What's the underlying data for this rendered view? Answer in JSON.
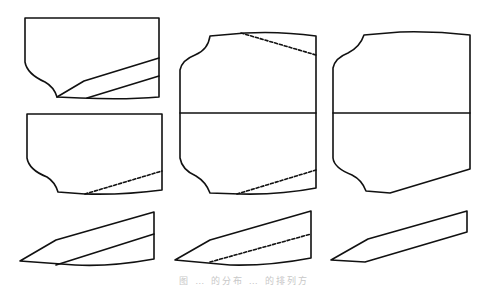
{
  "figure": {
    "caption": "图 … 的分布 … 的排列方",
    "stroke_color": "#111111",
    "background": "#ffffff",
    "panels": [
      {
        "id": "col1-top",
        "column": 1,
        "row": 1,
        "solid_inner_lines": 2,
        "dashed_inner_lines": 0
      },
      {
        "id": "col1-mid",
        "column": 1,
        "row": 2,
        "solid_inner_lines": 0,
        "dashed_inner_lines": 1
      },
      {
        "id": "col1-bottom",
        "column": 1,
        "row": 3,
        "shape": "wedge",
        "solid_inner_lines": 1,
        "dashed_inner_lines": 0
      },
      {
        "id": "col2-tall",
        "column": 2,
        "row": "1-2",
        "horizontal_divider": true,
        "dashed_inner_lines": 2
      },
      {
        "id": "col2-bottom",
        "column": 2,
        "row": 3,
        "shape": "wedge",
        "dashed_inner_lines": 1
      },
      {
        "id": "col3-tall",
        "column": 3,
        "row": "1-2",
        "horizontal_divider": true,
        "dashed_inner_lines": 0
      },
      {
        "id": "col3-bottom",
        "column": 3,
        "row": 3,
        "shape": "wedge",
        "dashed_inner_lines": 0
      }
    ]
  }
}
